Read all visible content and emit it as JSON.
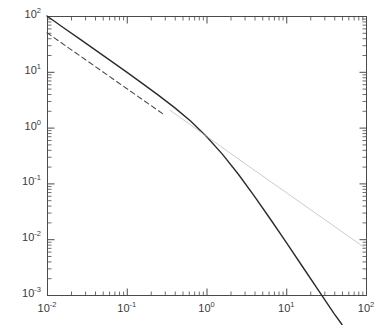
{
  "figure": {
    "background": "#ffffff",
    "axis_color": "#4a4a4a",
    "label_color": "#3a3a3a",
    "plot_box": {
      "left": 47,
      "top": 16,
      "right": 366,
      "bottom": 295
    }
  },
  "axes": {
    "x": {
      "scale": "log",
      "min": 0.01,
      "max": 100,
      "tick_labels": [
        "10-2",
        "10-1",
        "100",
        "101",
        "102"
      ],
      "tick_mantissas": [
        "10",
        "10",
        "10",
        "10",
        "10"
      ],
      "tick_exponents": [
        "-2",
        "-1",
        "0",
        "1",
        "2"
      ],
      "tick_values": [
        0.01,
        0.1,
        1,
        10,
        100
      ],
      "label": ""
    },
    "y": {
      "scale": "log",
      "min": 0.001,
      "max": 100,
      "tick_labels": [
        "102",
        "101",
        "100",
        "10-1",
        "10-2",
        "10-3"
      ],
      "tick_mantissas": [
        "10",
        "10",
        "10",
        "10",
        "10",
        "10"
      ],
      "tick_exponents": [
        "2",
        "1",
        "0",
        "-1",
        "-2",
        "-3"
      ],
      "tick_values": [
        100,
        10,
        1,
        0.1,
        0.01,
        0.001
      ],
      "label": ""
    }
  },
  "chart_data": {
    "type": "line",
    "title": "",
    "xlabel": "",
    "ylabel": "",
    "xscale": "log",
    "yscale": "log",
    "xlim": [
      0.01,
      100
    ],
    "ylim": [
      0.001,
      100
    ],
    "grid": false,
    "legend": "none",
    "series": [
      {
        "name": "main-curve",
        "style": "solid",
        "color": "#2b2b2b",
        "width": 1.4,
        "comment": "slope -1 at small x, bends near x=1 to slope -2",
        "x": [
          0.01,
          0.0158,
          0.0251,
          0.0398,
          0.0631,
          0.1,
          0.158,
          0.251,
          0.398,
          0.631,
          1.0,
          1.58,
          2.51,
          3.98,
          6.31,
          10.0,
          15.8,
          25.1,
          39.8,
          50.0
        ],
        "y": [
          100.0,
          63.0,
          39.7,
          25.0,
          15.7,
          9.85,
          6.13,
          3.78,
          2.28,
          1.31,
          0.693,
          0.335,
          0.146,
          0.0592,
          0.023,
          0.00877,
          0.00331,
          0.00124,
          0.000465,
          0.000296
        ]
      },
      {
        "name": "dashed-reference",
        "style": "dashed",
        "color": "#4a4a4a",
        "width": 1.1,
        "comment": "slope -1 reference line, 1/x scaled, truncated near x=0.3",
        "x": [
          0.01,
          0.02,
          0.04,
          0.08,
          0.15,
          0.3
        ],
        "y": [
          50.0,
          25.0,
          12.5,
          6.25,
          3.33,
          1.67
        ]
      },
      {
        "name": "thin-asymptote",
        "style": "solid-thin",
        "color": "#b4b4b4",
        "width": 0.7,
        "comment": "faint straight power-law continuation to lower-right corner",
        "x": [
          0.35,
          1.0,
          3.0,
          10.0,
          30.0,
          100.0
        ],
        "y": [
          2.04,
          0.7,
          0.229,
          0.0685,
          0.0227,
          0.0068
        ]
      }
    ]
  }
}
